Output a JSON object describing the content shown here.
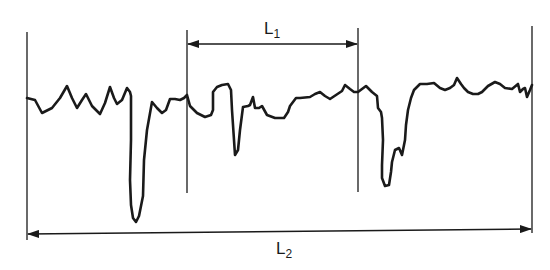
{
  "diagram": {
    "type": "surface-profile-measurement",
    "stroke_color": "#1a1a1a",
    "background": "#ffffff",
    "labels": {
      "l1": {
        "base": "L",
        "sub": "1"
      },
      "l2": {
        "base": "L",
        "sub": "2"
      }
    },
    "dimensions": {
      "l1": {
        "from_x": 187,
        "to_x": 358,
        "y": 44,
        "arrowheads": "both"
      },
      "l2": {
        "from_x": 27,
        "to_x": 532,
        "y_left": 234,
        "y_right": 229,
        "arrowheads": "both"
      }
    },
    "extension_lines": [
      {
        "name": "outer-left",
        "x": 27,
        "y1": 32,
        "y2": 240
      },
      {
        "name": "l1-left",
        "x": 187,
        "y1": 30,
        "y2": 193
      },
      {
        "name": "l1-right",
        "x": 358,
        "y1": 28,
        "y2": 192
      },
      {
        "name": "outer-right",
        "x": 532,
        "y1": 26,
        "y2": 233
      }
    ],
    "profile_points": [
      [
        27,
        98
      ],
      [
        35,
        100
      ],
      [
        42,
        113
      ],
      [
        52,
        108
      ],
      [
        60,
        98
      ],
      [
        67,
        86
      ],
      [
        72,
        98
      ],
      [
        77,
        108
      ],
      [
        82,
        100
      ],
      [
        86,
        94
      ],
      [
        92,
        106
      ],
      [
        100,
        114
      ],
      [
        105,
        103
      ],
      [
        110,
        87
      ],
      [
        114,
        98
      ],
      [
        117,
        104
      ],
      [
        122,
        100
      ],
      [
        127,
        88
      ],
      [
        130,
        92
      ],
      [
        131,
        96
      ],
      [
        131,
        140
      ],
      [
        130,
        180
      ],
      [
        131,
        205
      ],
      [
        133,
        218
      ],
      [
        136,
        222
      ],
      [
        139,
        216
      ],
      [
        141,
        206
      ],
      [
        143,
        196
      ],
      [
        144,
        160
      ],
      [
        147,
        130
      ],
      [
        152,
        102
      ],
      [
        157,
        108
      ],
      [
        162,
        113
      ],
      [
        166,
        110
      ],
      [
        170,
        99
      ],
      [
        175,
        99
      ],
      [
        180,
        100
      ],
      [
        184,
        98
      ],
      [
        187,
        95
      ],
      [
        190,
        106
      ],
      [
        197,
        113
      ],
      [
        205,
        117
      ],
      [
        211,
        115
      ],
      [
        213,
        110
      ],
      [
        213,
        92
      ],
      [
        217,
        87
      ],
      [
        222,
        85
      ],
      [
        228,
        84
      ],
      [
        231,
        90
      ],
      [
        232,
        110
      ],
      [
        234,
        140
      ],
      [
        235,
        155
      ],
      [
        238,
        150
      ],
      [
        240,
        130
      ],
      [
        243,
        107
      ],
      [
        248,
        106
      ],
      [
        250,
        105
      ],
      [
        253,
        97
      ],
      [
        255,
        108
      ],
      [
        259,
        108
      ],
      [
        262,
        106
      ],
      [
        267,
        115
      ],
      [
        275,
        118
      ],
      [
        284,
        118
      ],
      [
        288,
        112
      ],
      [
        290,
        106
      ],
      [
        296,
        98
      ],
      [
        300,
        98
      ],
      [
        310,
        97
      ],
      [
        315,
        94
      ],
      [
        320,
        92
      ],
      [
        325,
        96
      ],
      [
        330,
        99
      ],
      [
        336,
        95
      ],
      [
        342,
        91
      ],
      [
        345,
        85
      ],
      [
        350,
        89
      ],
      [
        354,
        92
      ],
      [
        358,
        92
      ],
      [
        362,
        89
      ],
      [
        366,
        86
      ],
      [
        370,
        90
      ],
      [
        372,
        92
      ],
      [
        377,
        96
      ],
      [
        378,
        108
      ],
      [
        381,
        112
      ],
      [
        382,
        118
      ],
      [
        383,
        140
      ],
      [
        382,
        165
      ],
      [
        382,
        178
      ],
      [
        385,
        186
      ],
      [
        389,
        185
      ],
      [
        391,
        172
      ],
      [
        392,
        162
      ],
      [
        395,
        150
      ],
      [
        399,
        148
      ],
      [
        402,
        155
      ],
      [
        405,
        140
      ],
      [
        406,
        125
      ],
      [
        408,
        110
      ],
      [
        411,
        98
      ],
      [
        414,
        90
      ],
      [
        420,
        84
      ],
      [
        427,
        84
      ],
      [
        434,
        83
      ],
      [
        440,
        88
      ],
      [
        445,
        90
      ],
      [
        450,
        88
      ],
      [
        454,
        85
      ],
      [
        457,
        78
      ],
      [
        461,
        84
      ],
      [
        464,
        88
      ],
      [
        468,
        92
      ],
      [
        473,
        94
      ],
      [
        478,
        94
      ],
      [
        482,
        92
      ],
      [
        488,
        86
      ],
      [
        495,
        82
      ],
      [
        500,
        84
      ],
      [
        505,
        88
      ],
      [
        512,
        89
      ],
      [
        518,
        84
      ],
      [
        520,
        92
      ],
      [
        523,
        89
      ],
      [
        525,
        88
      ],
      [
        527,
        97
      ],
      [
        530,
        90
      ],
      [
        532,
        85
      ]
    ]
  }
}
